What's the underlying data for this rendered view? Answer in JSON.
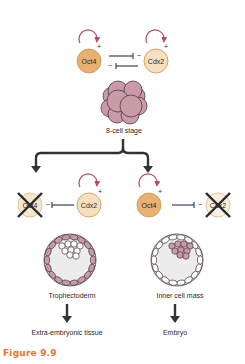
{
  "figure": {
    "caption": "Figure 9.9",
    "colors": {
      "oct4_fill": "#e8b173",
      "cdx2_fill": "#f6dfc0",
      "node_stroke": "#c99055",
      "loop_arrow": "#b04a6a",
      "inhibit_line": "#4a4e68",
      "cell_pink": "#c99aa8",
      "cell_stroke": "#4a3a40",
      "arrow_dark": "#333333",
      "caption": "#e0772b"
    }
  },
  "top": {
    "genes": [
      {
        "label": "Oct4",
        "self_sign": "+"
      },
      {
        "label": "Cdx2",
        "self_sign": "+"
      }
    ],
    "inhibit_signs": [
      "−",
      "−"
    ],
    "stage_label": "8-cell stage"
  },
  "left_branch": {
    "active_gene": "Cdx2",
    "active_sign": "+",
    "repressed_gene": "Oct4",
    "inhibit_sign": "−",
    "tissue_label": "Trophectoderm",
    "fate_label": "Extra-embryonic tissue"
  },
  "right_branch": {
    "active_gene": "Oct4",
    "active_sign": "+",
    "repressed_gene": "Cdx2",
    "inhibit_sign": "−",
    "tissue_label": "Inner cell mass",
    "fate_label": "Embryo"
  }
}
